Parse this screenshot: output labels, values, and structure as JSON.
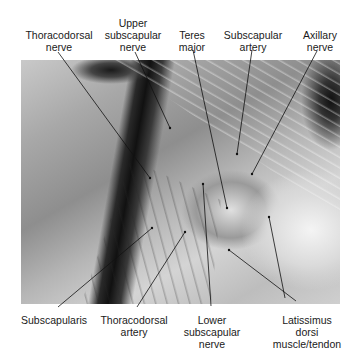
{
  "figure": {
    "labels_top": [
      {
        "id": "thoracodorsal-nerve",
        "lines": [
          "Thoracodorsal",
          "nerve"
        ]
      },
      {
        "id": "upper-subscapular-nerve",
        "lines": [
          "Upper",
          "subscapular",
          "nerve"
        ]
      },
      {
        "id": "teres-major",
        "lines": [
          "Teres",
          "major"
        ]
      },
      {
        "id": "subscapular-artery",
        "lines": [
          "Subscapular",
          "artery"
        ]
      },
      {
        "id": "axillary-nerve",
        "lines": [
          "Axillary",
          "nerve"
        ]
      }
    ],
    "labels_bottom": [
      {
        "id": "subscapularis",
        "lines": [
          "Subscapularis"
        ]
      },
      {
        "id": "thoracodorsal-artery",
        "lines": [
          "Thoracodorsal",
          "artery"
        ]
      },
      {
        "id": "lower-subscapular-nerve",
        "lines": [
          "Lower",
          "subscapular",
          "nerve"
        ]
      },
      {
        "id": "latissimus-dorsi",
        "lines": [
          "Latissimus",
          "dorsi",
          "muscle/tendon"
        ]
      }
    ],
    "colors": {
      "label_text": "#1a1a1a",
      "leader_line": "#111111",
      "background": "#ffffff"
    }
  }
}
